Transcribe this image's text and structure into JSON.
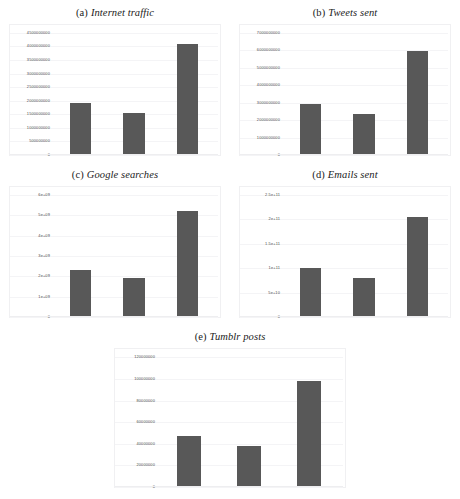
{
  "figure": {
    "layout": "2x2-plus-centered",
    "background": "#ffffff",
    "bar_color": "#585858",
    "gridline_color": "#f4f4f6",
    "panel_border_color": "#f0f0f2"
  },
  "chart_data": [
    {
      "id": "a",
      "type": "bar",
      "tag": "(a)",
      "title": "Internet traffic",
      "categories": [
        "",
        "",
        ""
      ],
      "values": [
        1900000000,
        1550000000,
        4100000000
      ],
      "xlabel": "",
      "ylabel": "",
      "ylim": [
        0,
        4500000000
      ],
      "ytick_values": [
        0,
        500000000,
        1000000000,
        1500000000,
        2000000000,
        2500000000,
        3000000000,
        3500000000,
        4000000000,
        4500000000
      ],
      "ytick_labels": [
        "0",
        "500000000",
        "1000000000",
        "1500000000",
        "2000000000",
        "2500000000",
        "3000000000",
        "3500000000",
        "4000000000",
        "4500000000"
      ],
      "grid": true,
      "legend": "none"
    },
    {
      "id": "b",
      "type": "bar",
      "tag": "(b)",
      "title": "Tweets sent",
      "categories": [
        "",
        "",
        ""
      ],
      "values": [
        2900000000,
        2350000000,
        5950000000
      ],
      "xlabel": "",
      "ylabel": "",
      "ylim": [
        0,
        7000000000
      ],
      "ytick_values": [
        0,
        1000000000,
        2000000000,
        3000000000,
        4000000000,
        5000000000,
        6000000000,
        7000000000
      ],
      "ytick_labels": [
        "0",
        "1000000000",
        "2000000000",
        "3000000000",
        "4000000000",
        "5000000000",
        "6000000000",
        "7000000000"
      ],
      "grid": true,
      "legend": "none"
    },
    {
      "id": "c",
      "type": "bar",
      "tag": "(c)",
      "title": "Google searches",
      "categories": [
        "",
        "",
        ""
      ],
      "values": [
        2300000000,
        1900000000,
        5200000000
      ],
      "xlabel": "",
      "ylabel": "",
      "ylim": [
        0,
        6000000000
      ],
      "ytick_values": [
        0,
        1000000000,
        2000000000,
        3000000000,
        4000000000,
        5000000000,
        6000000000
      ],
      "ytick_labels": [
        "0",
        "1e+09",
        "2e+09",
        "3e+09",
        "4e+09",
        "5e+09",
        "6e+09"
      ],
      "grid": true,
      "legend": "none"
    },
    {
      "id": "d",
      "type": "bar",
      "tag": "(d)",
      "title": "Emails sent",
      "categories": [
        "",
        "",
        ""
      ],
      "values": [
        100000000000,
        80000000000,
        205000000000
      ],
      "xlabel": "",
      "ylabel": "",
      "ylim": [
        0,
        250000000000
      ],
      "ytick_values": [
        0,
        50000000000,
        100000000000,
        150000000000,
        200000000000,
        250000000000
      ],
      "ytick_labels": [
        "0",
        "5e+10",
        "1e+11",
        "1.5e+11",
        "2e+11",
        "2.5e+11"
      ],
      "grid": true,
      "legend": "none"
    },
    {
      "id": "e",
      "type": "bar",
      "tag": "(e)",
      "title": "Tumblr posts",
      "categories": [
        "",
        "",
        ""
      ],
      "values": [
        47000000,
        38000000,
        98000000
      ],
      "xlabel": "",
      "ylabel": "",
      "ylim": [
        0,
        120000000
      ],
      "ytick_values": [
        0,
        20000000,
        40000000,
        60000000,
        80000000,
        100000000,
        120000000
      ],
      "ytick_labels": [
        "0",
        "20000000",
        "40000000",
        "60000000",
        "80000000",
        "100000000",
        "120000000"
      ],
      "grid": true,
      "legend": "none"
    }
  ]
}
